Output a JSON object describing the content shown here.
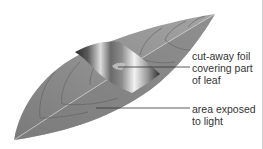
{
  "figure": {
    "labels": [
      {
        "id": "foil",
        "text": "cut-away foil\ncovering part\nof leaf"
      },
      {
        "id": "light",
        "text": "area exposed\nto light"
      }
    ]
  },
  "colors": {
    "leaf_dark": "#6f6f6f",
    "leaf_mid": "#8e8e8e",
    "leaf_light": "#a9a9a9",
    "vein": "#d4d4d4",
    "foil_dark": "#2a2a2a",
    "foil_light": "#f2f2f2",
    "leader_line": "#333333",
    "text": "#333333"
  }
}
